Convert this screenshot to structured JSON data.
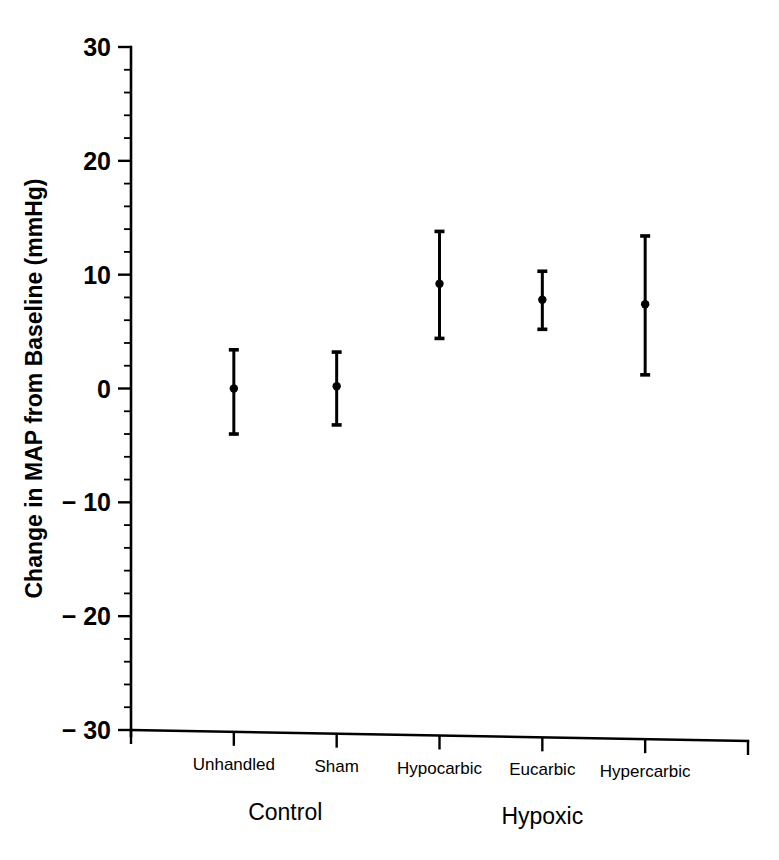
{
  "chart_data": {
    "type": "scatter",
    "title": "",
    "xlabel": "",
    "ylabel": "Change in MAP from Baseline (mmHg)",
    "ylim": [
      -30,
      30
    ],
    "yticks": [
      30,
      20,
      10,
      0,
      -10,
      -20,
      -30
    ],
    "ytick_labels": [
      "30",
      "20",
      "10",
      "0",
      "− 10",
      "− 20",
      "− 30"
    ],
    "minor_tick_interval": 2,
    "grid": false,
    "legend": null,
    "categories": [
      "Unhandled",
      "Sham",
      "Hypocarbic",
      "Eucarbic",
      "Hypercarbic"
    ],
    "groups": [
      {
        "label": "Control",
        "categories": [
          "Unhandled",
          "Sham"
        ]
      },
      {
        "label": "Hypoxic",
        "categories": [
          "Hypocarbic",
          "Eucarbic",
          "Hypercarbic"
        ]
      }
    ],
    "series": [
      {
        "name": "Change in MAP from Baseline",
        "marker": "dot-with-error-bars",
        "points": [
          {
            "category": "Unhandled",
            "value": 0.0,
            "upper": 3.4,
            "lower": -4.0
          },
          {
            "category": "Sham",
            "value": 0.2,
            "upper": 3.2,
            "lower": -3.2
          },
          {
            "category": "Hypocarbic",
            "value": 9.2,
            "upper": 13.8,
            "lower": 4.4
          },
          {
            "category": "Eucarbic",
            "value": 7.8,
            "upper": 10.3,
            "lower": 5.2
          },
          {
            "category": "Hypercarbic",
            "value": 7.4,
            "upper": 13.4,
            "lower": 1.2
          }
        ]
      }
    ]
  },
  "colors": {
    "foreground": "#000000",
    "background": "#ffffff"
  }
}
